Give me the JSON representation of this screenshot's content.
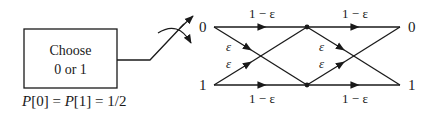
{
  "diagram": {
    "type": "cascaded binary symmetric channels",
    "source_box": {
      "line1": "Choose",
      "line2": "0 or 1"
    },
    "prior_label": "P[0] = P[1] = 1/2",
    "prior_parts": {
      "p": "P",
      "a": "[0] = ",
      "b": "[1] = 1/2"
    },
    "input_labels": {
      "top": "0",
      "bottom": "1"
    },
    "output_labels": {
      "top": "0",
      "bottom": "1"
    },
    "stages": [
      {
        "straight_top": "1 − ε",
        "straight_bottom": "1 − ε",
        "cross_down": "ε",
        "cross_up": "ε"
      },
      {
        "straight_top": "1 − ε",
        "straight_bottom": "1 − ε",
        "cross_down": "ε",
        "cross_up": "ε"
      }
    ],
    "colors": {
      "stroke": "#1a1a1a",
      "background": "#ffffff"
    }
  }
}
